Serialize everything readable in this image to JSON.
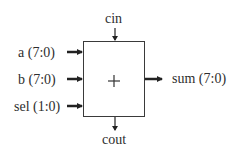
{
  "diagram": {
    "block": {
      "symbol": "+",
      "name": "adder"
    },
    "inputs": [
      {
        "label": "a (7:0)"
      },
      {
        "label": "b (7:0)"
      },
      {
        "label": "sel (1:0)"
      }
    ],
    "carry_in": {
      "label": "cin"
    },
    "carry_out": {
      "label": "cout"
    },
    "output": {
      "label": "sum (7:0)"
    },
    "colors": {
      "stroke": "#3a3a3a",
      "arrow": "#222222",
      "text": "#2e2e2e"
    }
  }
}
